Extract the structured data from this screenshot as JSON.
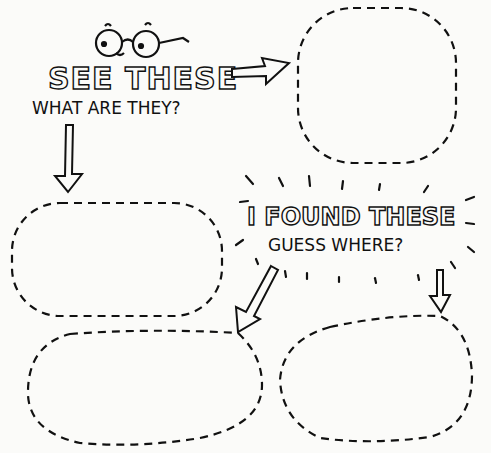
{
  "worksheet": {
    "heading_1": "SEE THESE",
    "subheading_1": "WHAT ARE THEY?",
    "heading_2": "I FOUND THESE",
    "subheading_2": "GUESS WHERE?"
  },
  "icons": [
    "glasses-face-icon",
    "arrow-right-icon",
    "arrow-down-icon",
    "arrow-down-left-icon",
    "arrow-down-icon-2",
    "sunburst-rays"
  ],
  "boxes": [
    "top-right-box",
    "middle-left-box",
    "bottom-left-box",
    "bottom-right-box"
  ],
  "colors": {
    "ink": "#111111",
    "paper": "#fbfbf9"
  }
}
